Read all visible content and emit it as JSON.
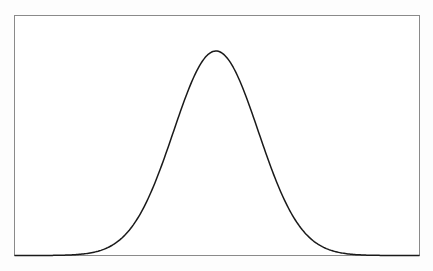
{
  "chart_data": {
    "type": "line",
    "title": "",
    "xlabel": "",
    "ylabel": "",
    "xlim": [
      -4.75,
      4.8
    ],
    "ylim": [
      0,
      0.42
    ],
    "grid": false,
    "legend": null,
    "series": [
      {
        "name": "normal pdf",
        "color": "#1a1a1a",
        "x": [
          -4.75,
          -4.5,
          -4.25,
          -4.0,
          -3.75,
          -3.5,
          -3.25,
          -3.0,
          -2.75,
          -2.5,
          -2.25,
          -2.0,
          -1.75,
          -1.5,
          -1.25,
          -1.0,
          -0.75,
          -0.5,
          -0.25,
          0.0,
          0.25,
          0.5,
          0.75,
          1.0,
          1.25,
          1.5,
          1.75,
          2.0,
          2.25,
          2.5,
          2.75,
          3.0,
          3.25,
          3.5,
          3.75,
          4.0,
          4.25,
          4.5,
          4.8
        ],
        "y": [
          0.0,
          0.0,
          0.0,
          0.0001,
          0.0004,
          0.0009,
          0.002,
          0.0044,
          0.0091,
          0.0175,
          0.0317,
          0.054,
          0.0863,
          0.1295,
          0.1826,
          0.242,
          0.3011,
          0.3521,
          0.3867,
          0.3989,
          0.3867,
          0.3521,
          0.3011,
          0.242,
          0.1826,
          0.1295,
          0.0863,
          0.054,
          0.0317,
          0.0175,
          0.0091,
          0.0044,
          0.002,
          0.0009,
          0.0004,
          0.0001,
          0.0,
          0.0,
          0.0
        ]
      }
    ]
  },
  "colors": {
    "background": "#fdfdfd",
    "frame": "#8a8a8a",
    "line": "#1a1a1a"
  }
}
